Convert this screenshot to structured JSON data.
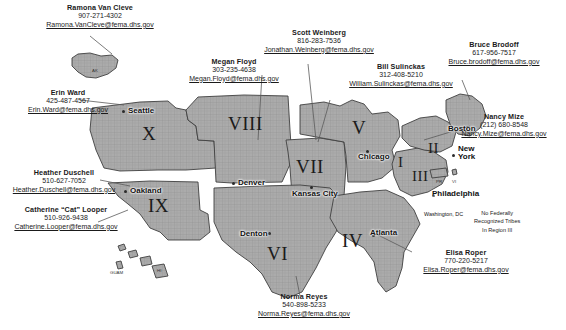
{
  "map": {
    "title": "FEMA Regional Tribal Liaison Map",
    "land_fill": "#a8a8a8",
    "land_stroke": "#4a4a4a",
    "background": "#ffffff"
  },
  "contacts": [
    {
      "id": "ramona-van-cleve",
      "name": "Ramona  Van Cleve",
      "phone": "907-271-4302",
      "email": "Ramona.VanCleve@fema.dhs.gov",
      "region": "X"
    },
    {
      "id": "erin-ward",
      "name": "Erin Ward",
      "phone": "425-487-4567",
      "email": "Erin.Ward@fema.dhs.gov",
      "region": "X"
    },
    {
      "id": "heather-duschell",
      "name": "Heather Duschell",
      "phone": "510-627-7052",
      "email": "Heather.Duschell@fema.dhs.gov",
      "region": "IX"
    },
    {
      "id": "catherine-looper",
      "name": "Catherine “Cat” Looper",
      "phone": "510-926-9438",
      "email": "Catherine.Looper@fema.dhs.gov",
      "region": "IX"
    },
    {
      "id": "megan-floyd",
      "name": "Megan Floyd",
      "phone": "303-235-4638",
      "email": "Megan.Floyd@fema.dhs.gov",
      "region": "VIII"
    },
    {
      "id": "scott-weinberg",
      "name": "Scott Weinberg",
      "phone": "816-283-7536",
      "email": "Jonathan.Weinberg@fema.dhs.gov",
      "region": "VII"
    },
    {
      "id": "bill-sulinckas",
      "name": "Bill Sulinckas",
      "phone": "312-408-5210",
      "email": "William.Sulinckas@fema.dhs.gov",
      "region": "V"
    },
    {
      "id": "bruce-brodoff",
      "name": "Bruce Brodoff",
      "phone": "617-956-7517",
      "email": "Bruce.brodoff@fema.dhs.gov",
      "region": "I"
    },
    {
      "id": "nancy-mize",
      "name": "Nancy Mize",
      "phone": "(212) 680-8548",
      "email": "Nancy.Mize@fema.dhs.gov",
      "region": "II"
    },
    {
      "id": "elisa-roper",
      "name": "Elisa Roper",
      "phone": "770-220-5217",
      "email": "Elisa.Roper@fema.dhs.gov",
      "region": "IV"
    },
    {
      "id": "norma-reyes",
      "name": "Norma Reyes",
      "phone": "540-898-5233",
      "email": "Norma.Reyes@fema.dhs.gov",
      "region": "VI"
    }
  ],
  "regions": [
    {
      "numeral": "X"
    },
    {
      "numeral": "IX"
    },
    {
      "numeral": "VIII"
    },
    {
      "numeral": "VII"
    },
    {
      "numeral": "VI"
    },
    {
      "numeral": "V"
    },
    {
      "numeral": "IV"
    },
    {
      "numeral": "III"
    },
    {
      "numeral": "II"
    },
    {
      "numeral": "I"
    }
  ],
  "cities": [
    {
      "name": "Seattle"
    },
    {
      "name": "Oakland"
    },
    {
      "name": "Denver"
    },
    {
      "name": "Denton"
    },
    {
      "name": "Kansas City"
    },
    {
      "name": "Chicago"
    },
    {
      "name": "Atlanta"
    },
    {
      "name": "Boston"
    },
    {
      "name": "New York"
    },
    {
      "name": "Philadelphia"
    },
    {
      "name": "Washington, DC"
    }
  ],
  "territory_labels": [
    {
      "name": "AK"
    },
    {
      "name": "GUAM"
    },
    {
      "name": "HI"
    },
    {
      "name": "PR"
    },
    {
      "name": "VI"
    }
  ],
  "note": {
    "line1": "No Federally",
    "line2": "Recognized Tribes",
    "line3": "In Region III"
  }
}
